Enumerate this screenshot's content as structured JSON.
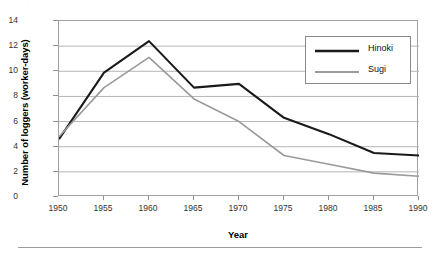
{
  "figure": {
    "top_remnant_text": "· · ·",
    "has_bottom_rule": true
  },
  "chart_data": {
    "type": "line",
    "title": "",
    "xlabel": "Year",
    "ylabel": "Number of loggers (worker-days)",
    "x": [
      1950,
      1955,
      1960,
      1965,
      1970,
      1975,
      1980,
      1985,
      1990
    ],
    "xtick_labels": [
      "1950",
      "1955",
      "1960",
      "1965",
      "1970",
      "1975",
      "1980",
      "1985",
      "1990"
    ],
    "ytick_labels": [
      "0",
      "2",
      "4",
      "6",
      "8",
      "10",
      "12",
      "14"
    ],
    "yticks": [
      0,
      2,
      4,
      6,
      8,
      10,
      12,
      14
    ],
    "xlim": [
      1950,
      1990
    ],
    "ylim": [
      0,
      14
    ],
    "grid": "horizontal",
    "legend_position": "top-right",
    "series": [
      {
        "name": "Hinoki",
        "color": "#1a1a1a",
        "width": 2.1,
        "values": [
          4.6,
          9.9,
          12.4,
          8.7,
          9.0,
          6.3,
          5.0,
          3.5,
          3.3
        ]
      },
      {
        "name": "Sugi",
        "color": "#9a9a9a",
        "width": 1.6,
        "values": [
          4.8,
          8.7,
          11.1,
          7.8,
          6.0,
          3.3,
          2.6,
          1.9,
          1.65
        ]
      }
    ]
  },
  "colors": {
    "axis": "#a0a0a0",
    "grid": "#b5b5b5",
    "text": "#111111",
    "hinoki": "#1a1a1a",
    "sugi": "#9a9a9a"
  }
}
